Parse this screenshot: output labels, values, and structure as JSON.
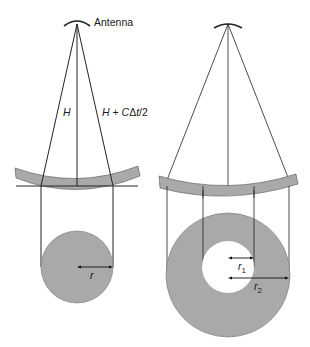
{
  "diagram": {
    "colors": {
      "background": "#ffffff",
      "shade": "#a9a9a9",
      "line": "#222222"
    },
    "left": {
      "antenna_label": "Antenna",
      "height_label": "H",
      "slant_label": "H + CΔt/2",
      "radius_label": "r"
    },
    "right": {
      "inner_radius_label": "r",
      "inner_radius_sub": "1",
      "outer_radius_label": "r",
      "outer_radius_sub": "2"
    }
  }
}
